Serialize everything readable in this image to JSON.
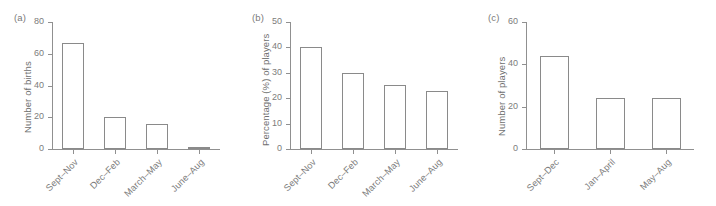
{
  "figure": {
    "background": "#ffffff",
    "line_color": "#8a8a8a",
    "text_color": "#7c7c7c"
  },
  "panels": [
    {
      "letter": "(a)",
      "ylabel": "Number of births",
      "yticks": [
        "0",
        "20",
        "40",
        "60",
        "80"
      ],
      "categories": [
        "Sept–Nov",
        "Dec–Feb",
        "March–May",
        "June–Aug"
      ],
      "values": [
        67,
        20,
        16,
        1
      ]
    },
    {
      "letter": "(b)",
      "ylabel": "Percentage (%) of players",
      "yticks": [
        "0",
        "10",
        "20",
        "30",
        "40",
        "50"
      ],
      "categories": [
        "Sept–Nov",
        "Dec–Feb",
        "March–May",
        "June–Aug"
      ],
      "values": [
        40,
        30,
        25,
        23
      ]
    },
    {
      "letter": "(c)",
      "ylabel": "Number of players",
      "yticks": [
        "0",
        "20",
        "40",
        "60"
      ],
      "categories": [
        "Sept–Dec",
        "Jan–April",
        "May–Aug"
      ],
      "values": [
        44,
        24,
        24
      ]
    }
  ],
  "chart_data": [
    {
      "type": "bar",
      "title": "(a)",
      "categories": [
        "Sept–Nov",
        "Dec–Feb",
        "March–May",
        "June–Aug"
      ],
      "values": [
        67,
        20,
        16,
        1
      ],
      "xlabel": "",
      "ylabel": "Number of births",
      "ylim": [
        0,
        80
      ],
      "yticks": [
        0,
        20,
        40,
        60,
        80
      ],
      "grid": false,
      "legend": false
    },
    {
      "type": "bar",
      "title": "(b)",
      "categories": [
        "Sept–Nov",
        "Dec–Feb",
        "March–May",
        "June–Aug"
      ],
      "values": [
        40,
        30,
        25,
        23
      ],
      "xlabel": "",
      "ylabel": "Percentage (%) of players",
      "ylim": [
        0,
        50
      ],
      "yticks": [
        0,
        10,
        20,
        30,
        40,
        50
      ],
      "grid": false,
      "legend": false
    },
    {
      "type": "bar",
      "title": "(c)",
      "categories": [
        "Sept–Dec",
        "Jan–April",
        "May–Aug"
      ],
      "values": [
        44,
        24,
        24
      ],
      "xlabel": "",
      "ylabel": "Number of players",
      "ylim": [
        0,
        60
      ],
      "yticks": [
        0,
        20,
        40,
        60
      ],
      "grid": false,
      "legend": false
    }
  ]
}
